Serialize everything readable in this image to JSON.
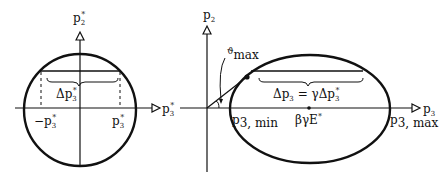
{
  "left_diagram": {
    "y_axis_label": "p",
    "y_axis_sub": "2",
    "y_axis_sup": "*",
    "x_axis_label": "p",
    "x_axis_sub": "3",
    "x_axis_sup": "*",
    "neg_tick_label": "−p",
    "neg_tick_sub": "3",
    "neg_tick_sup": "*",
    "pos_tick_label": "p",
    "pos_tick_sub": "3",
    "pos_tick_sup": "*",
    "brace_label": "Δp",
    "brace_sub": "3",
    "brace_sup": "*"
  },
  "right_diagram": {
    "y_axis_label": "p",
    "y_axis_sub": "2",
    "x_axis_label": "p",
    "x_axis_sub": "3",
    "angle_label": "ϑ",
    "angle_sub": "max",
    "min_label": "p",
    "min_sub": "3, min",
    "center_label": "βγE",
    "center_sup": "*",
    "max_label": "p",
    "max_sub": "3, max",
    "brace_label_a": "Δp",
    "brace_label_a_sub": "3",
    "brace_label_eq": " = γΔp",
    "brace_label_b_sub": "3",
    "brace_label_b_sup": "*"
  },
  "colors": {
    "ink": "#111111",
    "background": "#ffffff"
  }
}
